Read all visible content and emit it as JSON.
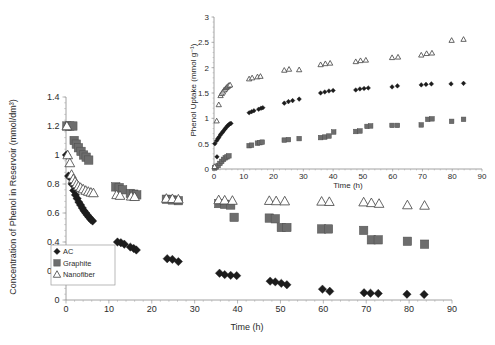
{
  "figure": {
    "background_color": "#ffffff",
    "colors": {
      "ac": "#1c1c1c",
      "graphite": "#6d6d6d",
      "nanofiber_stroke": "#4a4a4a",
      "nanofiber_fill": "#ffffff",
      "axis": "#8a8a8a",
      "text": "#2b2b2b"
    }
  },
  "chart_data": [
    {
      "id": "main",
      "type": "scatter",
      "title": "",
      "xlabel": "Time (h)",
      "ylabel": "Concentration of Phenol in Reservoir (mmol/dm³)",
      "xlim": [
        0,
        90
      ],
      "ylim": [
        0,
        1.4
      ],
      "xticks": [
        0,
        10,
        20,
        30,
        40,
        50,
        60,
        70,
        80,
        90
      ],
      "yticks": [
        0,
        0.2,
        0.4,
        0.6,
        0.8,
        1,
        1.2,
        1.4
      ],
      "xticklabels": [
        "0",
        "10",
        "20",
        "30",
        "40",
        "50",
        "60",
        "70",
        "80",
        "90"
      ],
      "yticklabels": [
        "0",
        "0.2",
        "0.4",
        "0.6",
        "0.8",
        "1",
        "1.2",
        "1.4"
      ],
      "grid": false,
      "minor_ticks": true,
      "legend_position": "lower-left-inside",
      "series": [
        {
          "name": "AC",
          "marker": "diamond",
          "color": "#1c1c1c",
          "points": [
            [
              0.1,
              1.0
            ],
            [
              0.6,
              0.855
            ],
            [
              1.0,
              0.845
            ],
            [
              1.4,
              0.8
            ],
            [
              1.8,
              0.755
            ],
            [
              2.2,
              0.725
            ],
            [
              2.6,
              0.7
            ],
            [
              3.0,
              0.675
            ],
            [
              3.4,
              0.655
            ],
            [
              3.8,
              0.635
            ],
            [
              4.2,
              0.615
            ],
            [
              4.6,
              0.6
            ],
            [
              5.0,
              0.585
            ],
            [
              5.4,
              0.57
            ],
            [
              5.8,
              0.555
            ],
            [
              6.2,
              0.545
            ],
            [
              12.0,
              0.4
            ],
            [
              12.8,
              0.395
            ],
            [
              13.6,
              0.385
            ],
            [
              15.0,
              0.365
            ],
            [
              15.8,
              0.355
            ],
            [
              16.4,
              0.345
            ],
            [
              23.6,
              0.285
            ],
            [
              24.8,
              0.28
            ],
            [
              26.2,
              0.265
            ],
            [
              35.8,
              0.185
            ],
            [
              37.0,
              0.175
            ],
            [
              38.4,
              0.17
            ],
            [
              39.8,
              0.168
            ],
            [
              47.6,
              0.13
            ],
            [
              48.8,
              0.125
            ],
            [
              50.2,
              0.115
            ],
            [
              51.5,
              0.105
            ],
            [
              59.8,
              0.075
            ],
            [
              61.5,
              0.06
            ],
            [
              69.5,
              0.05
            ],
            [
              71.0,
              0.047
            ],
            [
              72.8,
              0.045
            ],
            [
              79.5,
              0.04
            ],
            [
              83.5,
              0.038
            ]
          ]
        },
        {
          "name": "Graphite",
          "marker": "square",
          "color": "#6d6d6d",
          "points": [
            [
              0.2,
              1.2
            ],
            [
              0.9,
              1.2
            ],
            [
              1.6,
              1.2
            ],
            [
              1.9,
              1.1
            ],
            [
              2.4,
              1.075
            ],
            [
              2.9,
              1.05
            ],
            [
              3.5,
              1.025
            ],
            [
              4.1,
              1.0
            ],
            [
              4.7,
              0.985
            ],
            [
              5.3,
              0.965
            ],
            [
              11.6,
              0.78
            ],
            [
              12.4,
              0.775
            ],
            [
              13.2,
              0.76
            ],
            [
              15.0,
              0.735
            ],
            [
              15.8,
              0.73
            ],
            [
              16.5,
              0.725
            ],
            [
              23.4,
              0.695
            ],
            [
              24.8,
              0.69
            ],
            [
              26.2,
              0.685
            ],
            [
              35.6,
              0.665
            ],
            [
              37.0,
              0.66
            ],
            [
              38.4,
              0.655
            ],
            [
              39.2,
              0.57
            ],
            [
              47.4,
              0.565
            ],
            [
              48.8,
              0.56
            ],
            [
              50.2,
              0.5
            ],
            [
              51.5,
              0.5
            ],
            [
              59.6,
              0.49
            ],
            [
              61.2,
              0.49
            ],
            [
              69.4,
              0.48
            ],
            [
              71.2,
              0.415
            ],
            [
              72.8,
              0.415
            ],
            [
              79.6,
              0.405
            ],
            [
              83.6,
              0.385
            ]
          ]
        },
        {
          "name": "Nanofiber",
          "marker": "triangle",
          "color": "#4a4a4a",
          "points": [
            [
              0.2,
              1.2
            ],
            [
              0.4,
              1.0
            ],
            [
              0.9,
              0.945
            ],
            [
              1.3,
              0.865
            ],
            [
              1.7,
              0.835
            ],
            [
              2.1,
              0.815
            ],
            [
              2.5,
              0.8
            ],
            [
              2.9,
              0.785
            ],
            [
              3.4,
              0.775
            ],
            [
              4.0,
              0.765
            ],
            [
              4.6,
              0.755
            ],
            [
              5.2,
              0.748
            ],
            [
              5.8,
              0.742
            ],
            [
              6.4,
              0.738
            ],
            [
              11.8,
              0.725
            ],
            [
              12.6,
              0.72
            ],
            [
              15.2,
              0.715
            ],
            [
              16.0,
              0.712
            ],
            [
              23.4,
              0.7
            ],
            [
              24.8,
              0.698
            ],
            [
              26.2,
              0.695
            ],
            [
              35.6,
              0.69
            ],
            [
              37.0,
              0.688
            ],
            [
              38.8,
              0.686
            ],
            [
              47.4,
              0.685
            ],
            [
              49.0,
              0.683
            ],
            [
              51.0,
              0.682
            ],
            [
              59.6,
              0.68
            ],
            [
              61.4,
              0.678
            ],
            [
              69.4,
              0.675
            ],
            [
              71.2,
              0.67
            ],
            [
              73.0,
              0.665
            ],
            [
              79.6,
              0.655
            ],
            [
              83.6,
              0.652
            ]
          ]
        }
      ]
    },
    {
      "id": "inset",
      "type": "scatter",
      "title": "",
      "xlabel": "Time (h)",
      "ylabel": "Phenol Uptake (mmol g⁻¹)",
      "xlim": [
        0,
        90
      ],
      "ylim": [
        0,
        3
      ],
      "xticks": [
        0,
        10,
        20,
        30,
        40,
        50,
        60,
        70,
        80,
        90
      ],
      "yticks": [
        0,
        0.5,
        1,
        1.5,
        2,
        2.5,
        3
      ],
      "xticklabels": [
        "0",
        "10",
        "20",
        "30",
        "40",
        "50",
        "60",
        "70",
        "80",
        "90"
      ],
      "yticklabels": [
        "0",
        "0.5",
        "1",
        "1.5",
        "2",
        "2.5",
        "3"
      ],
      "grid": false,
      "minor_ticks": true,
      "legend_position": "none",
      "series": [
        {
          "name": "AC",
          "marker": "diamond",
          "color": "#1c1c1c",
          "points": [
            [
              0.3,
              0.5
            ],
            [
              0.9,
              0.56
            ],
            [
              1.3,
              0.6
            ],
            [
              1.7,
              0.63
            ],
            [
              2.1,
              0.67
            ],
            [
              2.5,
              0.7
            ],
            [
              2.9,
              0.73
            ],
            [
              3.3,
              0.76
            ],
            [
              3.7,
              0.79
            ],
            [
              4.1,
              0.82
            ],
            [
              4.5,
              0.85
            ],
            [
              4.9,
              0.87
            ],
            [
              5.3,
              0.89
            ],
            [
              5.7,
              0.9
            ],
            [
              1.0,
              0.24
            ],
            [
              11.8,
              1.11
            ],
            [
              12.6,
              1.13
            ],
            [
              13.4,
              1.15
            ],
            [
              15.0,
              1.18
            ],
            [
              15.8,
              1.2
            ],
            [
              16.4,
              1.21
            ],
            [
              23.6,
              1.3
            ],
            [
              25.0,
              1.33
            ],
            [
              26.4,
              1.35
            ],
            [
              28.6,
              1.38
            ],
            [
              35.8,
              1.5
            ],
            [
              37.2,
              1.52
            ],
            [
              38.6,
              1.54
            ],
            [
              40.0,
              1.55
            ],
            [
              47.6,
              1.56
            ],
            [
              49.0,
              1.58
            ],
            [
              50.4,
              1.59
            ],
            [
              51.8,
              1.6
            ],
            [
              59.8,
              1.62
            ],
            [
              61.6,
              1.64
            ],
            [
              69.6,
              1.66
            ],
            [
              71.2,
              1.67
            ],
            [
              73.0,
              1.68
            ],
            [
              79.6,
              1.68
            ],
            [
              83.8,
              1.69
            ]
          ]
        },
        {
          "name": "Graphite",
          "marker": "square",
          "color": "#6d6d6d",
          "points": [
            [
              0.2,
              0.02
            ],
            [
              0.8,
              0.04
            ],
            [
              1.4,
              0.07
            ],
            [
              2.0,
              0.11
            ],
            [
              2.6,
              0.15
            ],
            [
              3.2,
              0.19
            ],
            [
              3.8,
              0.22
            ],
            [
              4.4,
              0.24
            ],
            [
              5.0,
              0.26
            ],
            [
              11.8,
              0.46
            ],
            [
              12.6,
              0.47
            ],
            [
              14.6,
              0.51
            ],
            [
              15.4,
              0.52
            ],
            [
              16.2,
              0.53
            ],
            [
              23.6,
              0.57
            ],
            [
              25.0,
              0.58
            ],
            [
              28.6,
              0.6
            ],
            [
              35.8,
              0.62
            ],
            [
              37.2,
              0.63
            ],
            [
              38.6,
              0.65
            ],
            [
              40.2,
              0.73
            ],
            [
              47.6,
              0.74
            ],
            [
              49.0,
              0.75
            ],
            [
              51.4,
              0.84
            ],
            [
              52.6,
              0.85
            ],
            [
              59.8,
              0.86
            ],
            [
              61.6,
              0.86
            ],
            [
              69.6,
              0.87
            ],
            [
              71.8,
              0.98
            ],
            [
              73.2,
              0.99
            ],
            [
              79.8,
              0.94
            ],
            [
              83.8,
              0.98
            ]
          ]
        },
        {
          "name": "Nanofiber",
          "marker": "triangle",
          "color": "#4a4a4a",
          "points": [
            [
              0.2,
              0.05
            ],
            [
              0.9,
              0.95
            ],
            [
              1.6,
              1.27
            ],
            [
              2.2,
              1.45
            ],
            [
              2.6,
              1.49
            ],
            [
              3.0,
              1.52
            ],
            [
              3.4,
              1.56
            ],
            [
              3.8,
              1.58
            ],
            [
              4.2,
              1.61
            ],
            [
              4.6,
              1.63
            ],
            [
              5.0,
              1.65
            ],
            [
              5.4,
              1.66
            ],
            [
              11.8,
              1.78
            ],
            [
              12.8,
              1.8
            ],
            [
              14.6,
              1.82
            ],
            [
              15.6,
              1.83
            ],
            [
              23.6,
              1.95
            ],
            [
              25.2,
              1.97
            ],
            [
              28.6,
              1.96
            ],
            [
              35.8,
              2.06
            ],
            [
              37.4,
              2.08
            ],
            [
              39.0,
              2.09
            ],
            [
              47.6,
              2.12
            ],
            [
              49.2,
              2.14
            ],
            [
              51.0,
              2.15
            ],
            [
              59.8,
              2.2
            ],
            [
              61.8,
              2.21
            ],
            [
              69.6,
              2.25
            ],
            [
              71.4,
              2.28
            ],
            [
              73.2,
              2.29
            ],
            [
              79.8,
              2.54
            ],
            [
              83.8,
              2.56
            ]
          ]
        }
      ]
    }
  ],
  "main_legend": {
    "items": [
      {
        "label": "AC",
        "marker": "diamond",
        "color": "#1c1c1c"
      },
      {
        "label": "Graphite",
        "marker": "square",
        "color": "#6d6d6d"
      },
      {
        "label": "Nanofiber",
        "marker": "triangle",
        "color": "#4a4a4a"
      }
    ]
  }
}
